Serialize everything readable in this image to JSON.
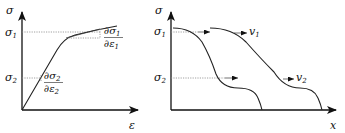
{
  "left_panel": {
    "y_axis_label": "σ",
    "x_axis_label": "ε",
    "levels": [
      {
        "symbol": "σ",
        "subscript": "1"
      },
      {
        "symbol": "σ",
        "subscript": "2"
      }
    ],
    "slope_labels": [
      {
        "num": "∂σ",
        "num_sub": "1",
        "den": "∂ε",
        "den_sub": "1"
      },
      {
        "num": "∂σ",
        "num_sub": "2",
        "den": "∂ε",
        "den_sub": "2"
      }
    ],
    "description": "Stress-strain curve with decreasing tangent slope at higher stress"
  },
  "right_panel": {
    "y_axis_label": "σ",
    "x_axis_label": "x",
    "levels": [
      {
        "symbol": "σ",
        "subscript": "1"
      },
      {
        "symbol": "σ",
        "subscript": "2"
      }
    ],
    "velocity_labels": [
      {
        "symbol": "v",
        "subscript": "1"
      },
      {
        "symbol": "v",
        "subscript": "2"
      }
    ],
    "description": "Stress wave profile propagating along x at two times; higher stress level moves at v1, lower at v2"
  }
}
